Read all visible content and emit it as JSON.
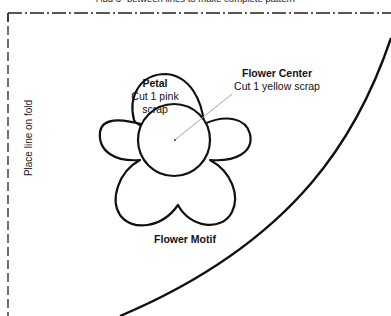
{
  "header": {
    "note": "Add 3\" between lines to make complete pattern"
  },
  "fold": {
    "label": "Place line on fold"
  },
  "petal": {
    "title": "Petal",
    "line1": "Cut 1 pink",
    "line2": "scrap"
  },
  "flower_center": {
    "title": "Flower Center",
    "line1": "Cut 1 yellow scrap"
  },
  "motif": {
    "title": "Flower Motif"
  },
  "colors": {
    "stroke": "#111111",
    "leader": "#999999",
    "background": "#ffffff"
  }
}
